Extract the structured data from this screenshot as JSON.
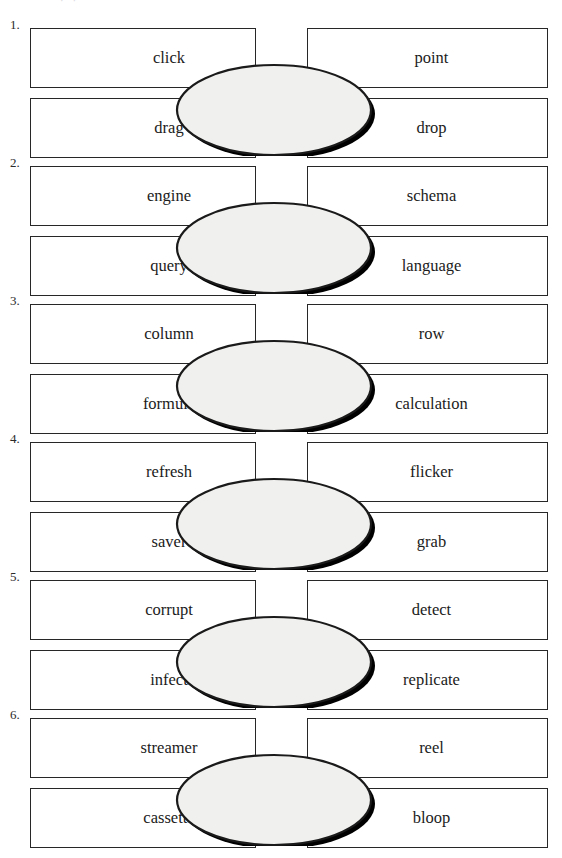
{
  "page": {
    "top_artifact": "· ·",
    "background_color": "#ffffff",
    "ink_color": "#1b1b1b",
    "ellipse_fill": "#f0f0ee",
    "ellipse_stroke": "#1a1a1a",
    "ellipse_shadow": "#000000"
  },
  "groups": [
    {
      "number": "1.",
      "top_left": "click",
      "top_right": "point",
      "bottom_left": "drag",
      "bottom_right": "drop",
      "center": ""
    },
    {
      "number": "2.",
      "top_left": "engine",
      "top_right": "schema",
      "bottom_left": "query",
      "bottom_right": "language",
      "center": ""
    },
    {
      "number": "3.",
      "top_left": "column",
      "top_right": "row",
      "bottom_left": "formula",
      "bottom_right": "calculation",
      "center": ""
    },
    {
      "number": "4.",
      "top_left": "refresh",
      "top_right": "flicker",
      "bottom_left": "saver",
      "bottom_right": "grab",
      "center": ""
    },
    {
      "number": "5.",
      "top_left": "corrupt",
      "top_right": "detect",
      "bottom_left": "infect",
      "bottom_right": "replicate",
      "center": ""
    },
    {
      "number": "6.",
      "top_left": "streamer",
      "top_right": "reel",
      "bottom_left": "cassette",
      "bottom_right": "bloop",
      "center": ""
    }
  ]
}
